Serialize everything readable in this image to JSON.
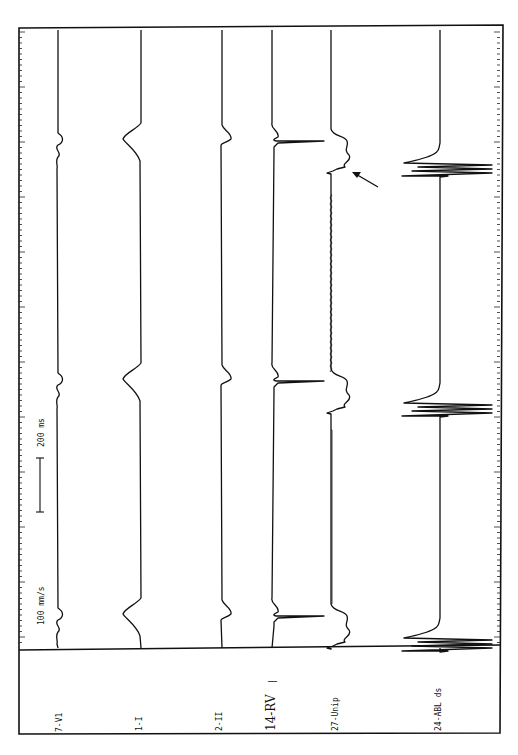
{
  "chart_data": {
    "type": "line",
    "title": "",
    "orientation": "rotated-90 (time runs top to bottom)",
    "paper_speed": "100 mm/s",
    "scale_bar": {
      "label": "200 ms"
    },
    "annotation": {
      "type": "arrow",
      "target": "27-Unip",
      "description": "arrow pointing to local potential on unipolar signal of first beat"
    },
    "channels": [
      {
        "label": "7-V1",
        "baseline_x": 58
      },
      {
        "label": "1-I",
        "baseline_x": 141
      },
      {
        "label": "2-II",
        "baseline_x": 222
      },
      {
        "label": "14-RV",
        "baseline_x": 272
      },
      {
        "label": "27-Unip",
        "baseline_x": 331
      },
      {
        "label": "24-ABL ds",
        "baseline_x": 440
      }
    ],
    "beats_y": [
      145,
      385,
      620
    ],
    "grid": false,
    "legend_position": "bottom panel (channel labels)"
  },
  "labels": {
    "speed": "100 mm/s",
    "scale": "200 ms",
    "rv_marker": "|",
    "ch": [
      "7-V1",
      "1-I",
      "2-II",
      "14-RV",
      "27-Unip",
      "24-ABL ds"
    ]
  }
}
